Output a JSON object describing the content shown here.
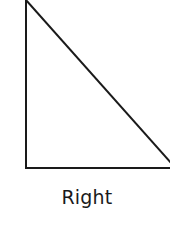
{
  "diagram": {
    "shape": "triangle",
    "type": "right",
    "label": "Right",
    "stroke_color": "#1a1a1a",
    "vertices": [
      [
        26,
        0
      ],
      [
        26,
        168
      ],
      [
        170,
        168
      ]
    ]
  }
}
